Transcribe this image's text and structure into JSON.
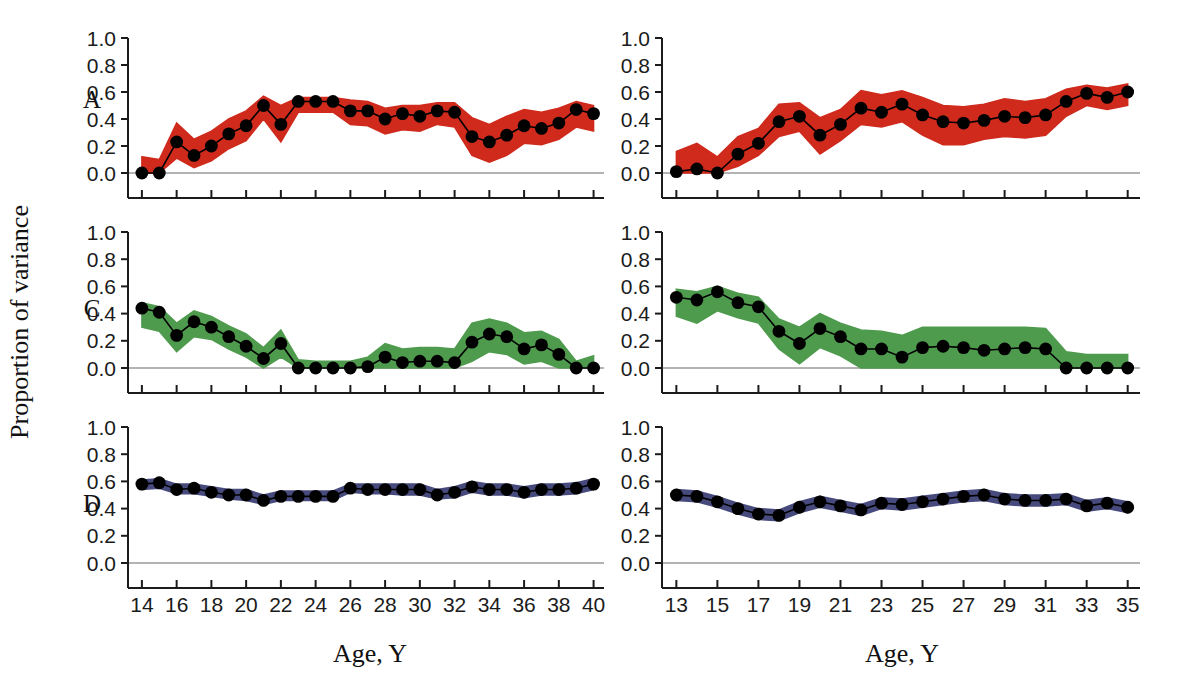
{
  "figure": {
    "ylabel": "Proportion of variance",
    "xlabel_left": "Age, Y",
    "xlabel_right": "Age, Y",
    "panel_letters": [
      "A",
      "C",
      "D"
    ],
    "colors": {
      "A": "#cf2a1c",
      "C": "#4f9b4e",
      "D": "#474a7c",
      "line": "#000000",
      "marker": "#000000",
      "axis": "#1b1b1b",
      "zero_line": "#9a9a9a"
    }
  },
  "chart_data": [
    {
      "type": "line",
      "panel": "A",
      "column": "left",
      "title": "",
      "xlabel": "Age, Y",
      "ylabel": "Proportion of variance",
      "xlim": [
        13.2,
        40.6
      ],
      "ylim": [
        -0.12,
        1.06
      ],
      "yticks": [
        0.0,
        0.2,
        0.4,
        0.6,
        0.8,
        1.0
      ],
      "ytick_labels": [
        "0.0",
        "0.2",
        "0.4",
        "0.6",
        "0.8",
        "1.0"
      ],
      "xticks": [
        14,
        16,
        18,
        20,
        22,
        24,
        26,
        28,
        30,
        32,
        34,
        36,
        38,
        40
      ],
      "xtick_labels": [
        "14",
        "16",
        "18",
        "20",
        "22",
        "24",
        "26",
        "28",
        "30",
        "32",
        "34",
        "36",
        "38",
        "40"
      ],
      "grid": false,
      "legend": "none",
      "band_color": "#cf2a1c",
      "x": [
        14,
        15,
        16,
        17,
        18,
        19,
        20,
        21,
        22,
        23,
        24,
        25,
        26,
        27,
        28,
        29,
        30,
        31,
        32,
        33,
        34,
        35,
        36,
        37,
        38,
        39,
        40
      ],
      "values": [
        0.0,
        0.0,
        0.23,
        0.13,
        0.2,
        0.29,
        0.35,
        0.5,
        0.36,
        0.53,
        0.53,
        0.53,
        0.46,
        0.46,
        0.4,
        0.44,
        0.42,
        0.46,
        0.45,
        0.27,
        0.23,
        0.28,
        0.35,
        0.33,
        0.37,
        0.47,
        0.44
      ],
      "band_lower": [
        0.0,
        0.0,
        0.11,
        0.04,
        0.09,
        0.18,
        0.24,
        0.4,
        0.23,
        0.45,
        0.45,
        0.45,
        0.36,
        0.35,
        0.29,
        0.32,
        0.31,
        0.36,
        0.34,
        0.13,
        0.08,
        0.13,
        0.22,
        0.21,
        0.25,
        0.34,
        0.31
      ],
      "band_upper": [
        0.12,
        0.1,
        0.37,
        0.25,
        0.31,
        0.4,
        0.46,
        0.57,
        0.5,
        0.56,
        0.56,
        0.56,
        0.54,
        0.53,
        0.48,
        0.5,
        0.5,
        0.52,
        0.52,
        0.41,
        0.36,
        0.42,
        0.47,
        0.45,
        0.48,
        0.53,
        0.5
      ]
    },
    {
      "type": "line",
      "panel": "A",
      "column": "right",
      "title": "",
      "xlabel": "Age, Y",
      "ylabel": "Proportion of variance",
      "xlim": [
        12.3,
        35.6
      ],
      "ylim": [
        -0.12,
        1.06
      ],
      "yticks": [
        0.0,
        0.2,
        0.4,
        0.6,
        0.8,
        1.0
      ],
      "ytick_labels": [
        "0.0",
        "0.2",
        "0.4",
        "0.6",
        "0.8",
        "1.0"
      ],
      "xticks": [
        13,
        15,
        17,
        19,
        21,
        23,
        25,
        27,
        29,
        31,
        33,
        35
      ],
      "xtick_labels": [
        "13",
        "15",
        "17",
        "19",
        "21",
        "23",
        "25",
        "27",
        "29",
        "31",
        "33",
        "35"
      ],
      "grid": false,
      "legend": "none",
      "band_color": "#cf2a1c",
      "x": [
        13,
        14,
        15,
        16,
        17,
        18,
        19,
        20,
        21,
        22,
        23,
        24,
        25,
        26,
        27,
        28,
        29,
        30,
        31,
        32,
        33,
        34,
        35
      ],
      "values": [
        0.01,
        0.03,
        0.0,
        0.14,
        0.22,
        0.38,
        0.42,
        0.28,
        0.36,
        0.48,
        0.45,
        0.51,
        0.43,
        0.38,
        0.37,
        0.39,
        0.42,
        0.41,
        0.43,
        0.53,
        0.59,
        0.56,
        0.6
      ],
      "band_lower": [
        0.0,
        0.0,
        0.0,
        0.05,
        0.13,
        0.27,
        0.31,
        0.14,
        0.24,
        0.36,
        0.34,
        0.38,
        0.28,
        0.21,
        0.21,
        0.25,
        0.27,
        0.26,
        0.28,
        0.42,
        0.5,
        0.47,
        0.5
      ],
      "band_upper": [
        0.16,
        0.22,
        0.12,
        0.27,
        0.33,
        0.51,
        0.52,
        0.41,
        0.47,
        0.61,
        0.58,
        0.61,
        0.56,
        0.5,
        0.49,
        0.51,
        0.55,
        0.53,
        0.55,
        0.62,
        0.65,
        0.63,
        0.66
      ]
    },
    {
      "type": "line",
      "panel": "C",
      "column": "left",
      "title": "",
      "xlabel": "Age, Y",
      "ylabel": "Proportion of variance",
      "xlim": [
        13.2,
        40.6
      ],
      "ylim": [
        -0.12,
        1.06
      ],
      "yticks": [
        0.0,
        0.2,
        0.4,
        0.6,
        0.8,
        1.0
      ],
      "ytick_labels": [
        "0.0",
        "0.2",
        "0.4",
        "0.6",
        "0.8",
        "1.0"
      ],
      "xticks": [
        14,
        16,
        18,
        20,
        22,
        24,
        26,
        28,
        30,
        32,
        34,
        36,
        38,
        40
      ],
      "xtick_labels": [
        "14",
        "16",
        "18",
        "20",
        "22",
        "24",
        "26",
        "28",
        "30",
        "32",
        "34",
        "36",
        "38",
        "40"
      ],
      "grid": false,
      "legend": "none",
      "band_color": "#4f9b4e",
      "x": [
        14,
        15,
        16,
        17,
        18,
        19,
        20,
        21,
        22,
        23,
        24,
        25,
        26,
        27,
        28,
        29,
        30,
        31,
        32,
        33,
        34,
        35,
        36,
        37,
        38,
        39,
        40
      ],
      "values": [
        0.44,
        0.41,
        0.24,
        0.34,
        0.3,
        0.23,
        0.16,
        0.07,
        0.18,
        0.0,
        0.0,
        0.0,
        0.0,
        0.01,
        0.08,
        0.04,
        0.05,
        0.05,
        0.04,
        0.19,
        0.25,
        0.23,
        0.14,
        0.17,
        0.1,
        0.0,
        0.0
      ],
      "band_lower": [
        0.3,
        0.27,
        0.12,
        0.23,
        0.21,
        0.14,
        0.08,
        0.0,
        0.08,
        0.0,
        0.0,
        0.0,
        0.0,
        0.0,
        0.0,
        0.0,
        0.0,
        0.0,
        0.0,
        0.05,
        0.12,
        0.1,
        0.03,
        0.05,
        0.0,
        0.0,
        0.0
      ],
      "band_upper": [
        0.48,
        0.45,
        0.33,
        0.42,
        0.38,
        0.31,
        0.25,
        0.15,
        0.28,
        0.06,
        0.05,
        0.05,
        0.05,
        0.08,
        0.18,
        0.14,
        0.15,
        0.15,
        0.14,
        0.33,
        0.36,
        0.33,
        0.26,
        0.27,
        0.21,
        0.05,
        0.09
      ]
    },
    {
      "type": "line",
      "panel": "C",
      "column": "right",
      "title": "",
      "xlabel": "Age, Y",
      "ylabel": "Proportion of variance",
      "xlim": [
        12.3,
        35.6
      ],
      "ylim": [
        -0.12,
        1.06
      ],
      "yticks": [
        0.0,
        0.2,
        0.4,
        0.6,
        0.8,
        1.0
      ],
      "ytick_labels": [
        "0.0",
        "0.2",
        "0.4",
        "0.6",
        "0.8",
        "1.0"
      ],
      "xticks": [
        13,
        15,
        17,
        19,
        21,
        23,
        25,
        27,
        29,
        31,
        33,
        35
      ],
      "xtick_labels": [
        "13",
        "15",
        "17",
        "19",
        "21",
        "23",
        "25",
        "27",
        "29",
        "31",
        "33",
        "35"
      ],
      "grid": false,
      "legend": "none",
      "band_color": "#4f9b4e",
      "x": [
        13,
        14,
        15,
        16,
        17,
        18,
        19,
        20,
        21,
        22,
        23,
        24,
        25,
        26,
        27,
        28,
        29,
        30,
        31,
        32,
        33,
        34,
        35
      ],
      "values": [
        0.52,
        0.5,
        0.56,
        0.48,
        0.45,
        0.27,
        0.18,
        0.29,
        0.23,
        0.14,
        0.14,
        0.08,
        0.15,
        0.16,
        0.15,
        0.13,
        0.14,
        0.15,
        0.14,
        0.0,
        0.0,
        0.0,
        0.0
      ],
      "band_lower": [
        0.38,
        0.33,
        0.42,
        0.37,
        0.33,
        0.14,
        0.03,
        0.15,
        0.09,
        0.0,
        0.0,
        0.0,
        0.0,
        0.0,
        0.0,
        0.0,
        0.0,
        0.0,
        0.0,
        0.0,
        0.0,
        0.0,
        0.0
      ],
      "band_upper": [
        0.58,
        0.56,
        0.6,
        0.55,
        0.52,
        0.36,
        0.3,
        0.4,
        0.33,
        0.28,
        0.27,
        0.24,
        0.3,
        0.3,
        0.3,
        0.3,
        0.3,
        0.3,
        0.29,
        0.12,
        0.1,
        0.1,
        0.1
      ]
    },
    {
      "type": "line",
      "panel": "D",
      "column": "left",
      "title": "",
      "xlabel": "Age, Y",
      "ylabel": "Proportion of variance",
      "xlim": [
        13.2,
        40.6
      ],
      "ylim": [
        -0.12,
        1.06
      ],
      "yticks": [
        0.0,
        0.2,
        0.4,
        0.6,
        0.8,
        1.0
      ],
      "ytick_labels": [
        "0.0",
        "0.2",
        "0.4",
        "0.6",
        "0.8",
        "1.0"
      ],
      "xticks": [
        14,
        16,
        18,
        20,
        22,
        24,
        26,
        28,
        30,
        32,
        34,
        36,
        38,
        40
      ],
      "xtick_labels": [
        "14",
        "16",
        "18",
        "20",
        "22",
        "24",
        "26",
        "28",
        "30",
        "32",
        "34",
        "36",
        "38",
        "40"
      ],
      "grid": false,
      "legend": "none",
      "band_color": "#474a7c",
      "x": [
        14,
        15,
        16,
        17,
        18,
        19,
        20,
        21,
        22,
        23,
        24,
        25,
        26,
        27,
        28,
        29,
        30,
        31,
        32,
        33,
        34,
        35,
        36,
        37,
        38,
        39,
        40
      ],
      "values": [
        0.58,
        0.59,
        0.54,
        0.55,
        0.52,
        0.5,
        0.5,
        0.46,
        0.49,
        0.49,
        0.49,
        0.49,
        0.55,
        0.54,
        0.54,
        0.54,
        0.54,
        0.5,
        0.52,
        0.56,
        0.54,
        0.54,
        0.52,
        0.54,
        0.54,
        0.55,
        0.58
      ],
      "band_lower": [
        0.54,
        0.55,
        0.51,
        0.51,
        0.49,
        0.47,
        0.46,
        0.43,
        0.46,
        0.46,
        0.46,
        0.46,
        0.52,
        0.51,
        0.51,
        0.5,
        0.5,
        0.47,
        0.48,
        0.52,
        0.5,
        0.5,
        0.48,
        0.5,
        0.5,
        0.51,
        0.54
      ],
      "band_upper": [
        0.61,
        0.62,
        0.58,
        0.58,
        0.56,
        0.54,
        0.54,
        0.5,
        0.53,
        0.53,
        0.53,
        0.53,
        0.58,
        0.58,
        0.58,
        0.58,
        0.58,
        0.54,
        0.56,
        0.6,
        0.58,
        0.58,
        0.56,
        0.58,
        0.58,
        0.59,
        0.62
      ]
    },
    {
      "type": "line",
      "panel": "D",
      "column": "right",
      "title": "",
      "xlabel": "Age, Y",
      "ylabel": "Proportion of variance",
      "xlim": [
        12.3,
        35.6
      ],
      "ylim": [
        -0.12,
        1.06
      ],
      "yticks": [
        0.0,
        0.2,
        0.4,
        0.6,
        0.8,
        1.0
      ],
      "ytick_labels": [
        "0.0",
        "0.2",
        "0.4",
        "0.6",
        "0.8",
        "1.0"
      ],
      "xticks": [
        13,
        15,
        17,
        19,
        21,
        23,
        25,
        27,
        29,
        31,
        33,
        35
      ],
      "xtick_labels": [
        "13",
        "15",
        "17",
        "19",
        "21",
        "23",
        "25",
        "27",
        "29",
        "31",
        "33",
        "35"
      ],
      "grid": false,
      "legend": "none",
      "band_color": "#474a7c",
      "x": [
        13,
        14,
        15,
        16,
        17,
        18,
        19,
        20,
        21,
        22,
        23,
        24,
        25,
        26,
        27,
        28,
        29,
        30,
        31,
        32,
        33,
        34,
        35
      ],
      "values": [
        0.5,
        0.49,
        0.45,
        0.4,
        0.36,
        0.35,
        0.41,
        0.45,
        0.42,
        0.39,
        0.44,
        0.43,
        0.45,
        0.47,
        0.49,
        0.5,
        0.47,
        0.46,
        0.46,
        0.47,
        0.42,
        0.44,
        0.41
      ],
      "band_lower": [
        0.46,
        0.45,
        0.41,
        0.36,
        0.32,
        0.31,
        0.37,
        0.41,
        0.38,
        0.35,
        0.4,
        0.39,
        0.41,
        0.43,
        0.45,
        0.46,
        0.43,
        0.42,
        0.42,
        0.43,
        0.38,
        0.4,
        0.37
      ],
      "band_upper": [
        0.54,
        0.53,
        0.49,
        0.44,
        0.4,
        0.39,
        0.45,
        0.49,
        0.46,
        0.43,
        0.48,
        0.47,
        0.49,
        0.51,
        0.53,
        0.54,
        0.51,
        0.5,
        0.5,
        0.51,
        0.46,
        0.48,
        0.45
      ]
    }
  ]
}
